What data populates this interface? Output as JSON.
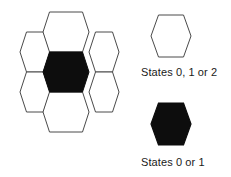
{
  "figure": {
    "background_color": "#ffffff",
    "stroke_color": "#4a4a4a",
    "fill_color": "#0d0d0d",
    "empty_fill_color": "#ffffff"
  },
  "cluster": {
    "description": "Hexagonal neighbourhood: one central cell surrounded by six adjacent cells",
    "orientation": "flat-top",
    "cell_count": 7,
    "cells": [
      {
        "position": "center",
        "state": "filled",
        "fill": "#0d0d0d"
      },
      {
        "position": "top",
        "state": "empty",
        "fill": "#ffffff"
      },
      {
        "position": "upper-right",
        "state": "empty",
        "fill": "#ffffff"
      },
      {
        "position": "lower-right",
        "state": "empty",
        "fill": "#ffffff"
      },
      {
        "position": "bottom",
        "state": "empty",
        "fill": "#ffffff"
      },
      {
        "position": "lower-left",
        "state": "empty",
        "fill": "#ffffff"
      },
      {
        "position": "upper-left",
        "state": "empty",
        "fill": "#ffffff"
      }
    ]
  },
  "legend": {
    "entries": [
      {
        "swatch": "hexagon-outline",
        "fill": "#ffffff",
        "stroke": "#4a4a4a",
        "label": "States 0, 1 or 2"
      },
      {
        "swatch": "hexagon-filled",
        "fill": "#0d0d0d",
        "stroke": "#0d0d0d",
        "label": "States 0 or 1"
      }
    ]
  }
}
